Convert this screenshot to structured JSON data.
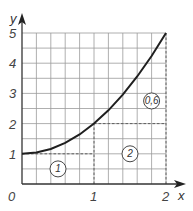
{
  "chart_data": {
    "type": "line",
    "title": "",
    "xlabel": "x",
    "ylabel": "y",
    "xlim": [
      0,
      2
    ],
    "ylim": [
      0,
      5
    ],
    "grid": true,
    "x_minor_step": 0.2,
    "y_minor_step": 0.5,
    "x_ticks": [
      {
        "value": 0,
        "label": "0"
      },
      {
        "value": 1,
        "label": "1"
      },
      {
        "value": 2,
        "label": "2"
      }
    ],
    "y_ticks": [
      {
        "value": 1,
        "label": "1"
      },
      {
        "value": 2,
        "label": "2"
      },
      {
        "value": 3,
        "label": "3"
      },
      {
        "value": 4,
        "label": "4"
      },
      {
        "value": 5,
        "label": "5"
      }
    ],
    "series": [
      {
        "name": "y = x^2 + 1",
        "x": [
          0,
          0.2,
          0.4,
          0.6,
          0.8,
          1.0,
          1.2,
          1.4,
          1.6,
          1.8,
          2.0
        ],
        "y": [
          1,
          1.04,
          1.16,
          1.36,
          1.64,
          2.0,
          2.44,
          2.96,
          3.56,
          4.24,
          5.0
        ]
      }
    ],
    "dashed_lines": [
      {
        "from": [
          0,
          1
        ],
        "to": [
          1,
          1
        ]
      },
      {
        "from": [
          1,
          2
        ],
        "to": [
          2,
          2
        ]
      },
      {
        "from": [
          1,
          0
        ],
        "to": [
          1,
          2
        ]
      },
      {
        "from": [
          2,
          0
        ],
        "to": [
          2,
          5
        ]
      }
    ],
    "annotations": [
      {
        "text": "1",
        "x": 0.5,
        "y": 0.5,
        "style": "circled"
      },
      {
        "text": "2",
        "x": 1.5,
        "y": 1.0,
        "style": "circled"
      },
      {
        "text": "0,6",
        "x": 1.8,
        "y": 2.75,
        "style": "circled"
      }
    ]
  }
}
